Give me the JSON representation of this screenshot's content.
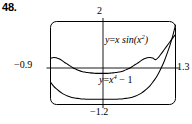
{
  "problem": {
    "number": "48."
  },
  "chart_data": {
    "type": "line",
    "title": "",
    "xlabel": "",
    "ylabel": "",
    "xlim": [
      -0.9,
      1.3
    ],
    "ylim": [
      -1.2,
      2
    ],
    "grid": false,
    "legend_position": "inline-annotations",
    "axis_labels": {
      "top": "2",
      "bottom": "−1.2",
      "left": "−0.9",
      "right": "1.3"
    },
    "annotations": [
      {
        "id": "curve-1-label",
        "text_plain": "y = x sin(x²)",
        "lhs": "y",
        "eq": "=",
        "rhs_lead": "x sin(x",
        "rhs_exp": "2",
        "rhs_tail": ")"
      },
      {
        "id": "curve-2-label",
        "text_plain": "y = x⁴ − 1",
        "lhs": "y",
        "eq": "=",
        "rhs_lead": "x",
        "rhs_exp": "4",
        "rhs_tail": " − 1"
      }
    ],
    "series": [
      {
        "name": "y = x sin(x^2)",
        "label": "y = x sin(x²)",
        "color": "#000000",
        "points": [
          [
            -0.9,
            0.58
          ],
          [
            -0.85,
            0.61
          ],
          [
            -0.8,
            0.6
          ],
          [
            -0.75,
            0.56
          ],
          [
            -0.7,
            0.5
          ],
          [
            -0.65,
            0.42
          ],
          [
            -0.6,
            0.35
          ],
          [
            -0.55,
            0.28
          ],
          [
            -0.5,
            0.21
          ],
          [
            -0.45,
            0.16
          ],
          [
            -0.4,
            0.11
          ],
          [
            -0.35,
            0.07
          ],
          [
            -0.3,
            0.05
          ],
          [
            -0.25,
            0.03
          ],
          [
            -0.2,
            0.02
          ],
          [
            -0.15,
            0.01
          ],
          [
            -0.1,
            0.0
          ],
          [
            -0.05,
            0.0
          ],
          [
            0.0,
            0.0
          ],
          [
            0.05,
            0.0
          ],
          [
            0.1,
            0.0
          ],
          [
            0.15,
            0.01
          ],
          [
            0.2,
            0.02
          ],
          [
            0.25,
            0.03
          ],
          [
            0.3,
            0.05
          ],
          [
            0.35,
            0.07
          ],
          [
            0.4,
            0.11
          ],
          [
            0.45,
            0.16
          ],
          [
            0.5,
            0.21
          ],
          [
            0.55,
            0.28
          ],
          [
            0.6,
            0.35
          ],
          [
            0.65,
            0.42
          ],
          [
            0.7,
            0.5
          ],
          [
            0.75,
            0.56
          ],
          [
            0.8,
            0.6
          ],
          [
            0.85,
            0.61
          ],
          [
            0.9,
            0.59
          ],
          [
            0.95,
            0.53
          ],
          [
            1.0,
            0.62
          ],
          [
            1.05,
            0.76
          ],
          [
            1.1,
            0.91
          ],
          [
            1.15,
            1.06
          ],
          [
            1.2,
            1.21
          ],
          [
            1.25,
            1.36
          ],
          [
            1.3,
            1.5
          ]
        ]
      },
      {
        "name": "y = x^4 - 1",
        "label": "y = x⁴ − 1",
        "color": "#000000",
        "points": [
          [
            -0.9,
            -0.34
          ],
          [
            -0.85,
            -0.48
          ],
          [
            -0.8,
            -0.59
          ],
          [
            -0.75,
            -0.68
          ],
          [
            -0.7,
            -0.76
          ],
          [
            -0.65,
            -0.82
          ],
          [
            -0.6,
            -0.87
          ],
          [
            -0.55,
            -0.91
          ],
          [
            -0.5,
            -0.94
          ],
          [
            -0.45,
            -0.96
          ],
          [
            -0.4,
            -0.97
          ],
          [
            -0.35,
            -0.99
          ],
          [
            -0.3,
            -0.99
          ],
          [
            -0.25,
            -1.0
          ],
          [
            -0.2,
            -1.0
          ],
          [
            -0.1,
            -1.0
          ],
          [
            0.0,
            -1.0
          ],
          [
            0.1,
            -1.0
          ],
          [
            0.2,
            -1.0
          ],
          [
            0.25,
            -1.0
          ],
          [
            0.3,
            -0.99
          ],
          [
            0.35,
            -0.99
          ],
          [
            0.4,
            -0.97
          ],
          [
            0.45,
            -0.96
          ],
          [
            0.5,
            -0.94
          ],
          [
            0.55,
            -0.91
          ],
          [
            0.6,
            -0.87
          ],
          [
            0.65,
            -0.82
          ],
          [
            0.7,
            -0.76
          ],
          [
            0.75,
            -0.68
          ],
          [
            0.8,
            -0.59
          ],
          [
            0.85,
            -0.48
          ],
          [
            0.9,
            -0.34
          ],
          [
            0.95,
            -0.19
          ],
          [
            1.0,
            0.0
          ],
          [
            1.05,
            0.22
          ],
          [
            1.1,
            0.46
          ],
          [
            1.15,
            0.75
          ],
          [
            1.2,
            1.07
          ],
          [
            1.25,
            1.44
          ],
          [
            1.3,
            1.86
          ]
        ]
      }
    ]
  }
}
